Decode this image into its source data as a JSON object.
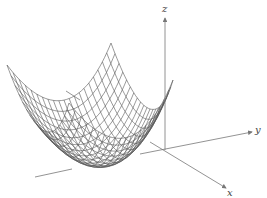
{
  "figure": {
    "surface": {
      "type": "paraboloid",
      "grid_lines": 20,
      "color": "#555555"
    },
    "axes": {
      "color": "#777777",
      "x": {
        "label": "x"
      },
      "y": {
        "label": "y"
      },
      "z": {
        "label": "z"
      }
    }
  }
}
